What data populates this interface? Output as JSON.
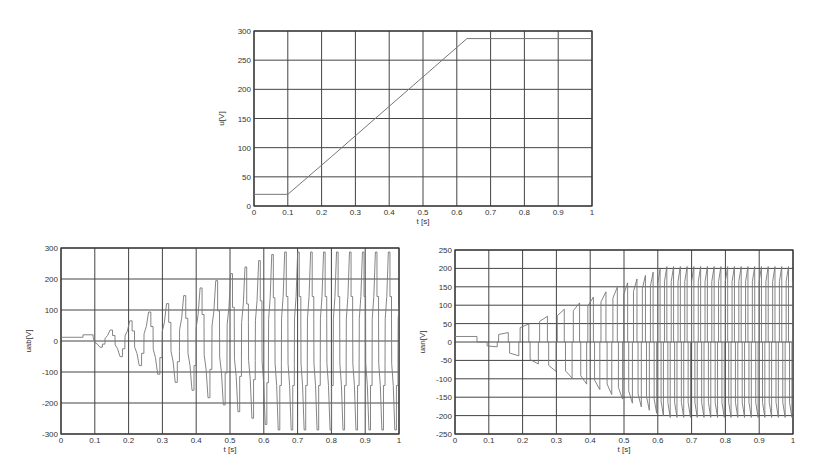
{
  "chart_data": [
    {
      "id": "top",
      "type": "line",
      "title": "",
      "xlabel": "t [s]",
      "ylabel": "u[V]",
      "xlim": [
        0,
        1
      ],
      "ylim": [
        0,
        300
      ],
      "xticks": [
        "0",
        "0.1",
        "0.2",
        "0.3",
        "0.4",
        "0.5",
        "0.6",
        "0.7",
        "0.8",
        "0.9",
        "1"
      ],
      "yticks": [
        "0",
        "50",
        "100",
        "150",
        "200",
        "250",
        "300"
      ],
      "grid": true,
      "frame": {
        "x0": 254,
        "y0": 31,
        "x1": 592,
        "y1": 206
      },
      "series": [
        {
          "name": "u",
          "x": [
            0,
            0.1,
            0.23,
            0.63,
            1.0
          ],
          "y": [
            20,
            20,
            85,
            287,
            287
          ]
        }
      ]
    },
    {
      "id": "bottom-left",
      "type": "line",
      "title": "",
      "xlabel": "t [s]",
      "ylabel": "uab[V]",
      "xlim": [
        0,
        1
      ],
      "ylim": [
        -300,
        300
      ],
      "xticks": [
        "0",
        "0.1",
        "0.2",
        "0.3",
        "0.4",
        "0.5",
        "0.6",
        "0.7",
        "0.8",
        "0.9",
        "1"
      ],
      "yticks": [
        "-300",
        "-200",
        "-100",
        "0",
        "100",
        "200",
        "300"
      ],
      "grid": true,
      "frame": {
        "x0": 61,
        "y0": 248,
        "x1": 399,
        "y1": 434
      },
      "series": [
        {
          "name": "u_ab",
          "description": "stepped line-to-line PWM voltage; envelope grows from ~20 V to ~287 V by t=0.63 s, inner step at ~±145 V",
          "start_value": 12,
          "envelope_start": 20,
          "envelope_end": 287,
          "ramp_start": 0.1,
          "ramp_end": 0.63,
          "period_start": 0.1,
          "period_end": 0.02,
          "inner_level": 145
        }
      ]
    },
    {
      "id": "bottom-right",
      "type": "line",
      "title": "",
      "xlabel": "t [s]",
      "ylabel": "uan[V]",
      "xlim": [
        0,
        1
      ],
      "ylim": [
        -250,
        250
      ],
      "xticks": [
        "0",
        "0.1",
        "0.2",
        "0.3",
        "0.4",
        "0.5",
        "0.6",
        "0.7",
        "0.8",
        "0.9",
        "1"
      ],
      "yticks": [
        "-250",
        "-200",
        "-150",
        "-100",
        "-50",
        "0",
        "50",
        "100",
        "150",
        "200",
        "250"
      ],
      "grid": true,
      "frame": {
        "x0": 455,
        "y0": 250,
        "x1": 793,
        "y1": 434
      },
      "series": [
        {
          "name": "u_an",
          "description": "phase voltage pulses; amplitude grows from ~15 V to ~205 V by t=0.62 s",
          "start_value": 15,
          "envelope_start": 15,
          "envelope_end": 205,
          "ramp_start": 0.1,
          "ramp_end": 0.62,
          "period_start": 0.08,
          "period_end": 0.02
        }
      ]
    }
  ]
}
